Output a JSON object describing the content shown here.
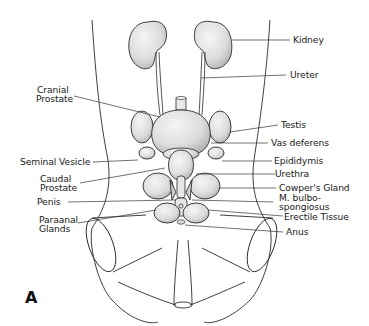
{
  "figure": {
    "panel_letter": "A",
    "colors": {
      "line": "#2a2a2a",
      "organ_fill": "#e6e6e6",
      "organ_shade": "#b8b8b8",
      "background": "#ffffff"
    },
    "labels_right": [
      {
        "id": "kidney",
        "text": "Kidney"
      },
      {
        "id": "ureter",
        "text": "Ureter"
      },
      {
        "id": "testis",
        "text": "Testis"
      },
      {
        "id": "vas-deferens",
        "text": "Vas deferens"
      },
      {
        "id": "epididymis",
        "text": "Epididymis"
      },
      {
        "id": "urethra",
        "text": "Urethra"
      },
      {
        "id": "cowpers-gland",
        "text": "Cowper's Gland"
      },
      {
        "id": "m-bulbo-line1",
        "text": "M. bulbo-"
      },
      {
        "id": "m-bulbo-line2",
        "text": "spongiosus"
      },
      {
        "id": "erectile-tissue",
        "text": "Erectile Tissue"
      },
      {
        "id": "anus",
        "text": "Anus"
      }
    ],
    "labels_left": [
      {
        "id": "cranial-prostate-1",
        "text": "Cranial"
      },
      {
        "id": "cranial-prostate-2",
        "text": "Prostate"
      },
      {
        "id": "seminal-vesicle",
        "text": "Seminal Vesicle"
      },
      {
        "id": "caudal-prostate-1",
        "text": "Caudal"
      },
      {
        "id": "caudal-prostate-2",
        "text": "Prostate"
      },
      {
        "id": "penis",
        "text": "Penis"
      },
      {
        "id": "paraanal-glands-1",
        "text": "Paraanal"
      },
      {
        "id": "paraanal-glands-2",
        "text": "Glands"
      }
    ]
  }
}
